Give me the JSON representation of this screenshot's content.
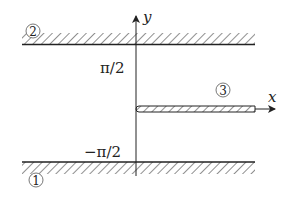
{
  "diagram": {
    "axes": {
      "x_label": "x",
      "y_label": "y"
    },
    "ticks": {
      "upper": "π/2",
      "lower": "−π/2"
    },
    "regions": [
      {
        "id": "1",
        "label": "①",
        "description": "lower hatched boundary y = −π/2"
      },
      {
        "id": "2",
        "label": "②",
        "description": "upper hatched boundary y = π/2"
      },
      {
        "id": "3",
        "label": "③",
        "description": "hatched slit along positive x-axis"
      }
    ],
    "colors": {
      "ink": "#222222",
      "background": "#ffffff"
    }
  }
}
